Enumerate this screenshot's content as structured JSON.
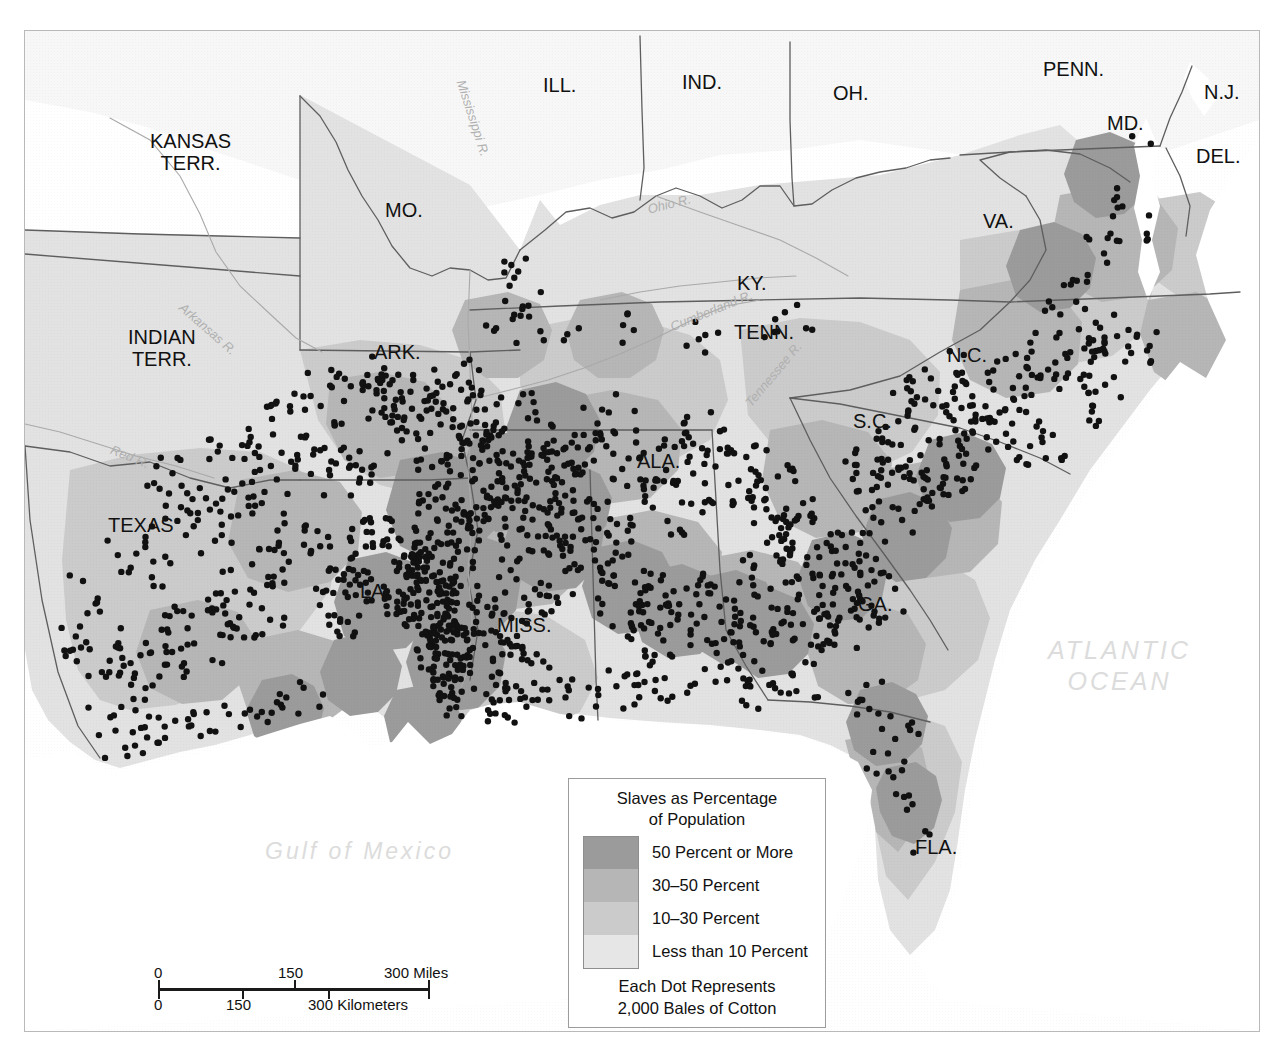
{
  "map": {
    "title_context": "Slavery and Cotton Production in the American South, 1860",
    "state_labels": [
      {
        "name": "kansas-terr",
        "text": "KANSAS\nTERR.",
        "x": 150,
        "y": 130
      },
      {
        "name": "indian-terr",
        "text": "INDIAN\nTERR.",
        "x": 128,
        "y": 326
      },
      {
        "name": "missouri",
        "text": "MO.",
        "x": 385,
        "y": 200
      },
      {
        "name": "illinois",
        "text": "ILL.",
        "x": 543,
        "y": 75
      },
      {
        "name": "indiana",
        "text": "IND.",
        "x": 682,
        "y": 72
      },
      {
        "name": "ohio",
        "text": "OH.",
        "x": 833,
        "y": 83
      },
      {
        "name": "pennsylvania",
        "text": "PENN.",
        "x": 1043,
        "y": 59
      },
      {
        "name": "new-jersey",
        "text": "N.J.",
        "x": 1204,
        "y": 82
      },
      {
        "name": "maryland",
        "text": "MD.",
        "x": 1107,
        "y": 113
      },
      {
        "name": "delaware",
        "text": "DEL.",
        "x": 1196,
        "y": 146
      },
      {
        "name": "virginia",
        "text": "VA.",
        "x": 983,
        "y": 211
      },
      {
        "name": "kentucky",
        "text": "KY.",
        "x": 737,
        "y": 273
      },
      {
        "name": "tennessee",
        "text": "TENN.",
        "x": 734,
        "y": 322
      },
      {
        "name": "north-carolina",
        "text": "N.C.",
        "x": 947,
        "y": 345
      },
      {
        "name": "south-carolina",
        "text": "S.C.",
        "x": 853,
        "y": 411
      },
      {
        "name": "arkansas",
        "text": "ARK.",
        "x": 374,
        "y": 342
      },
      {
        "name": "texas",
        "text": "TEXAS",
        "x": 108,
        "y": 515
      },
      {
        "name": "louisiana",
        "text": "LA.",
        "x": 360,
        "y": 581
      },
      {
        "name": "mississippi",
        "text": "MISS.",
        "x": 497,
        "y": 615
      },
      {
        "name": "alabama",
        "text": "ALA.",
        "x": 637,
        "y": 451
      },
      {
        "name": "georgia",
        "text": "GA.",
        "x": 858,
        "y": 594
      },
      {
        "name": "florida",
        "text": "FLA.",
        "x": 915,
        "y": 837
      }
    ],
    "river_labels": [
      {
        "name": "mississippi-river",
        "text": "Mississippi R.",
        "x": 468,
        "y": 78,
        "rot": 72
      },
      {
        "name": "ohio-river",
        "text": "Ohio R.",
        "x": 646,
        "y": 202,
        "rot": -14
      },
      {
        "name": "cumberland-river",
        "text": "Cumberland R.",
        "x": 668,
        "y": 320,
        "rot": -22
      },
      {
        "name": "tennessee-river",
        "text": "Tennessee R.",
        "x": 742,
        "y": 400,
        "rot": -50
      },
      {
        "name": "arkansas-river",
        "text": "Arkansas R.",
        "x": 186,
        "y": 300,
        "rot": 41
      },
      {
        "name": "red-river",
        "text": "Red R.",
        "x": 114,
        "y": 442,
        "rot": 22
      }
    ],
    "ocean_labels": [
      {
        "name": "gulf-of-mexico",
        "text": "Gulf of Mexico",
        "x": 265,
        "y": 838
      },
      {
        "name": "atlantic-ocean",
        "text": "ATLANTIC\nOCEAN",
        "x": 1048,
        "y": 635
      }
    ]
  },
  "legend": {
    "title": "Slaves as Percentage\nof Population",
    "entries": [
      {
        "label": "50 Percent or More",
        "color": "#9b9b9b"
      },
      {
        "label": "30–50 Percent",
        "color": "#b6b6b6"
      },
      {
        "label": "10–30 Percent",
        "color": "#cbcbcb"
      },
      {
        "label": "Less than 10 Percent",
        "color": "#e6e6e6"
      }
    ],
    "note": "Each Dot Represents\n2,000 Bales of Cotton"
  },
  "scalebar": {
    "miles": {
      "ticks": [
        "0",
        "150",
        "300 Miles"
      ],
      "unit": "Miles"
    },
    "kilometers": {
      "ticks": [
        "0",
        "150",
        "300 Kilometers"
      ],
      "unit": "Kilometers"
    }
  },
  "chart_data": {
    "type": "map",
    "title": "Slaves as Percentage of Population",
    "classes": [
      "50 Percent or More",
      "30–50 Percent",
      "10–30 Percent",
      "Less than 10 Percent"
    ],
    "class_colors": [
      "#9b9b9b",
      "#b6b6b6",
      "#cbcbcb",
      "#e6e6e6"
    ],
    "dot_value": 2000,
    "dot_unit": "Bales of Cotton",
    "dot_count_approx": 1450,
    "scale_miles": [
      0,
      150,
      300
    ],
    "scale_kilometers": [
      0,
      150,
      300
    ],
    "regions_shown": [
      "KANSAS TERR.",
      "INDIAN TERR.",
      "MO.",
      "ILL.",
      "IND.",
      "OH.",
      "PENN.",
      "N.J.",
      "MD.",
      "DEL.",
      "VA.",
      "KY.",
      "TENN.",
      "N.C.",
      "S.C.",
      "ARK.",
      "TEXAS",
      "LA.",
      "MISS.",
      "ALA.",
      "GA.",
      "FLA."
    ],
    "water_bodies": [
      "Gulf of Mexico",
      "ATLANTIC OCEAN"
    ],
    "rivers": [
      "Mississippi R.",
      "Ohio R.",
      "Cumberland R.",
      "Tennessee R.",
      "Arkansas R.",
      "Red R."
    ]
  }
}
